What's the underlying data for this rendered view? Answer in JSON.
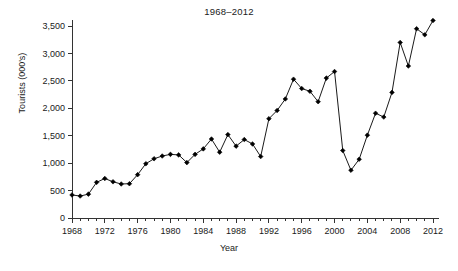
{
  "chart_data": {
    "type": "line",
    "title": "1968–2012",
    "xlabel": "Year",
    "ylabel": "Tourists (000's)",
    "xlim": [
      1968,
      2012
    ],
    "ylim": [
      0,
      3700
    ],
    "grid": false,
    "legend": null,
    "marker": "diamond",
    "line_color": "#000000",
    "marker_color": "#000000",
    "y_ticks": [
      0,
      500,
      1000,
      1500,
      2000,
      2500,
      3000,
      3500
    ],
    "y_tick_labels": [
      "0",
      "500",
      "1,000",
      "1,500",
      "2,000",
      "2,500",
      "3,000",
      "3,500"
    ],
    "x_ticks": [
      1968,
      1972,
      1976,
      1980,
      1984,
      1988,
      1992,
      1996,
      2000,
      2004,
      2008,
      2012
    ],
    "x_tick_labels": [
      "1968",
      "1972",
      "1976",
      "1980",
      "1984",
      "1988",
      "1992",
      "1996",
      "2000",
      "2004",
      "2008",
      "2012"
    ],
    "x_minor_tick_interval": 1,
    "x": [
      1968,
      1969,
      1970,
      1971,
      1972,
      1973,
      1974,
      1975,
      1976,
      1977,
      1978,
      1979,
      1980,
      1981,
      1982,
      1983,
      1984,
      1985,
      1986,
      1987,
      1988,
      1989,
      1990,
      1991,
      1992,
      1993,
      1994,
      1995,
      1996,
      1997,
      1998,
      1999,
      2000,
      2001,
      2002,
      2003,
      2004,
      2005,
      2006,
      2007,
      2008,
      2009,
      2010,
      2011,
      2012
    ],
    "values": [
      420,
      400,
      435,
      650,
      720,
      660,
      620,
      625,
      790,
      990,
      1080,
      1130,
      1160,
      1150,
      1010,
      1160,
      1260,
      1440,
      1200,
      1520,
      1310,
      1430,
      1350,
      1120,
      1810,
      1960,
      2170,
      2530,
      2360,
      2310,
      2120,
      2550,
      2670,
      1230,
      870,
      1070,
      1510,
      1910,
      1840,
      2290,
      3200,
      2770,
      3450,
      3340,
      3600
    ]
  }
}
